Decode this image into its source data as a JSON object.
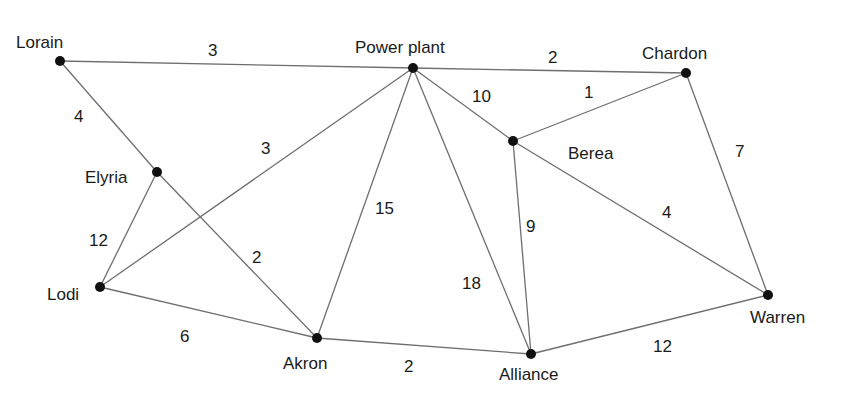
{
  "diagram": {
    "type": "weighted-undirected-graph",
    "nodes": [
      {
        "id": "lorain",
        "label": "Lorain",
        "x": 60,
        "y": 61,
        "lx": 16,
        "ly": 48
      },
      {
        "id": "power_plant",
        "label": "Power plant",
        "x": 413,
        "y": 68,
        "lx": 355,
        "ly": 53
      },
      {
        "id": "chardon",
        "label": "Chardon",
        "x": 686,
        "y": 73,
        "lx": 642,
        "ly": 59
      },
      {
        "id": "elyria",
        "label": "Elyria",
        "x": 157,
        "y": 172,
        "lx": 85,
        "ly": 183
      },
      {
        "id": "berea",
        "label": "Berea",
        "x": 513,
        "y": 141,
        "lx": 568,
        "ly": 159
      },
      {
        "id": "lodi",
        "label": "Lodi",
        "x": 100,
        "y": 287,
        "lx": 47,
        "ly": 300
      },
      {
        "id": "akron",
        "label": "Akron",
        "x": 317,
        "y": 338,
        "lx": 283,
        "ly": 369
      },
      {
        "id": "alliance",
        "label": "Alliance",
        "x": 531,
        "y": 354,
        "lx": 499,
        "ly": 380
      },
      {
        "id": "warren",
        "label": "Warren",
        "x": 768,
        "y": 295,
        "lx": 750,
        "ly": 323
      }
    ],
    "edges": [
      {
        "from": "lorain",
        "to": "power_plant",
        "weight": "3",
        "wx": 208,
        "wy": 56
      },
      {
        "from": "power_plant",
        "to": "chardon",
        "weight": "2",
        "wx": 548,
        "wy": 63
      },
      {
        "from": "lorain",
        "to": "elyria",
        "weight": "4",
        "wx": 74,
        "wy": 122
      },
      {
        "from": "power_plant",
        "to": "lodi",
        "weight": "3",
        "wx": 261,
        "wy": 154
      },
      {
        "from": "power_plant",
        "to": "akron",
        "weight": "15",
        "wx": 375,
        "wy": 214
      },
      {
        "from": "power_plant",
        "to": "alliance",
        "weight": "18",
        "wx": 462,
        "wy": 289
      },
      {
        "from": "power_plant",
        "to": "berea",
        "weight": "10",
        "wx": 472,
        "wy": 102
      },
      {
        "from": "berea",
        "to": "chardon",
        "weight": "1",
        "wx": 584,
        "wy": 98
      },
      {
        "from": "berea",
        "to": "alliance",
        "weight": "9",
        "wx": 526,
        "wy": 232
      },
      {
        "from": "berea",
        "to": "warren",
        "weight": "4",
        "wx": 662,
        "wy": 218
      },
      {
        "from": "chardon",
        "to": "warren",
        "weight": "7",
        "wx": 735,
        "wy": 157
      },
      {
        "from": "elyria",
        "to": "lodi",
        "weight": "12",
        "wx": 89,
        "wy": 246
      },
      {
        "from": "elyria",
        "to": "akron",
        "weight": "2",
        "wx": 252,
        "wy": 263
      },
      {
        "from": "lodi",
        "to": "akron",
        "weight": "6",
        "wx": 180,
        "wy": 342
      },
      {
        "from": "akron",
        "to": "alliance",
        "weight": "2",
        "wx": 404,
        "wy": 372
      },
      {
        "from": "alliance",
        "to": "warren",
        "weight": "12",
        "wx": 653,
        "wy": 352
      }
    ]
  },
  "colors": {
    "edge": "#6e6e6e",
    "node": "#111111",
    "text": "#1a1a1a",
    "background": "#ffffff"
  }
}
